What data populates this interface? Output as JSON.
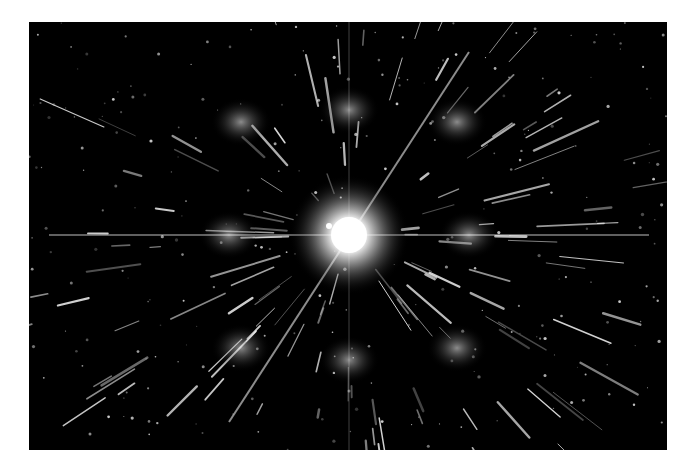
{
  "image": {
    "subject": "diffraction pattern",
    "background_color": "#000000",
    "page_color": "#ffffff",
    "center": {
      "x": 320,
      "y": 213
    },
    "lobes": [
      {
        "x": 320,
        "y": 88
      },
      {
        "x": 320,
        "y": 338
      },
      {
        "x": 200,
        "y": 213
      },
      {
        "x": 440,
        "y": 213
      },
      {
        "x": 212,
        "y": 100
      },
      {
        "x": 428,
        "y": 100
      },
      {
        "x": 212,
        "y": 326
      },
      {
        "x": 428,
        "y": 326
      }
    ]
  }
}
